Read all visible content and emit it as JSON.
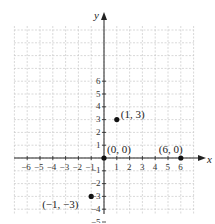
{
  "chart_data": {
    "type": "scatter",
    "title": "",
    "xlabel": "x",
    "ylabel": "y",
    "xlim": [
      -7,
      7
    ],
    "ylim": [
      -7,
      7
    ],
    "grid": true,
    "x_ticks": [
      -6,
      -5,
      -4,
      -3,
      -2,
      -1,
      1,
      2,
      3,
      4,
      5,
      6
    ],
    "y_ticks": [
      -6,
      -5,
      -4,
      -3,
      -2,
      -1,
      1,
      2,
      3,
      4,
      5,
      6
    ],
    "x_tick_labels": [
      "−6",
      "−5",
      "−4",
      "−3",
      "−2",
      "−1",
      "1",
      "2",
      "3",
      "4",
      "5",
      "6"
    ],
    "y_tick_labels": [
      "−6",
      "−5",
      "−4",
      "−3",
      "−2",
      "−1",
      "1",
      "2",
      "3",
      "4",
      "5",
      "6"
    ],
    "points": [
      {
        "x": 1,
        "y": 3,
        "label": "(1, 3)"
      },
      {
        "x": 0,
        "y": 0,
        "label": "(0, 0)"
      },
      {
        "x": 6,
        "y": 0,
        "label": "(6, 0)"
      },
      {
        "x": -1,
        "y": -3,
        "label": "(−1, −3)"
      }
    ],
    "annotations": [
      "(1, 3)",
      "(0, 0)",
      "(6, 0)",
      "(−1, −3)"
    ]
  },
  "axes": {
    "x_label": "x",
    "y_label": "y"
  },
  "colors": {
    "axis": "#222222",
    "grid": "#c8c8c8",
    "point": "#111111",
    "text": "#222222"
  }
}
